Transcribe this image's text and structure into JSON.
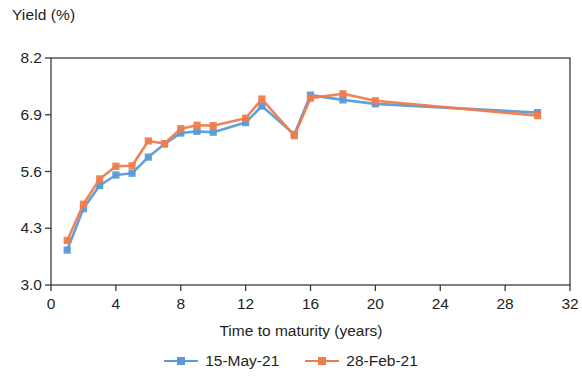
{
  "chart_data": {
    "type": "line",
    "title": "",
    "xlabel": "Time to maturity (years)",
    "ylabel": "Yield (%)",
    "xlim": [
      0,
      32
    ],
    "ylim": [
      3.0,
      8.2
    ],
    "xticks": [
      "0",
      "4",
      "8",
      "12",
      "16",
      "20",
      "24",
      "28",
      "32"
    ],
    "yticks": [
      "3.0",
      "4.3",
      "5.6",
      "6.9",
      "8.2"
    ],
    "grid": false,
    "legend_position": "bottom-center",
    "x": [
      1,
      2,
      3,
      4,
      5,
      6,
      7,
      8,
      9,
      10,
      12,
      13,
      15,
      16,
      18,
      20,
      30
    ],
    "series": [
      {
        "name": "15-May-21",
        "color": "#5b9bd5",
        "marker": "square",
        "values": [
          3.8,
          4.75,
          5.28,
          5.52,
          5.56,
          5.93,
          6.23,
          6.48,
          6.52,
          6.5,
          6.72,
          7.1,
          6.45,
          7.35,
          7.24,
          7.15,
          6.95
        ]
      },
      {
        "name": "28-Feb-21",
        "color": "#ed7d4e",
        "marker": "square",
        "values": [
          4.02,
          4.85,
          5.43,
          5.72,
          5.73,
          6.3,
          6.24,
          6.58,
          6.66,
          6.65,
          6.82,
          7.26,
          6.42,
          7.28,
          7.38,
          7.22,
          6.88
        ]
      }
    ]
  },
  "axes": {
    "frame_color": "#3c3c3c",
    "background": "#ffffff"
  },
  "legend": {
    "items": [
      {
        "label": "15-May-21",
        "color": "#5b9bd5"
      },
      {
        "label": "28-Feb-21",
        "color": "#ed7d4e"
      }
    ]
  }
}
